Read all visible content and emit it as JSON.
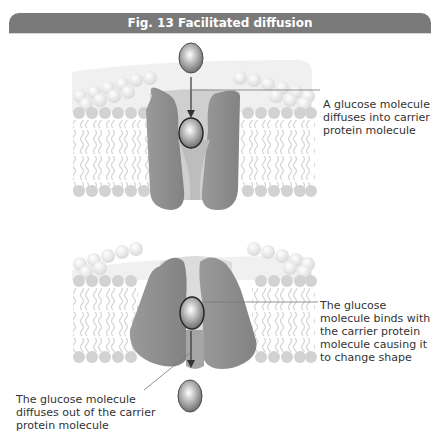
{
  "figure": {
    "title": "Fig. 13  Facilitated diffusion",
    "colors": {
      "title_bar": "#7a7a7a",
      "protein": "#8f8f8f",
      "phospholipid_head": "#d4d4d4",
      "tail": "#d8d8d8",
      "glucose": "#8a8a8a"
    }
  },
  "stages": [
    {
      "id": "stage-1",
      "annotation": "A glucose molecule diffuses into carrier protein molecule"
    },
    {
      "id": "stage-2",
      "annotation_binds": "The glucose molecule binds with the carrier protein molecule causing it to change shape",
      "annotation_exit": "The glucose molecule diffuses out of the carrier protein molecule"
    }
  ],
  "icons": {
    "glucose": "glucose-molecule-icon",
    "protein": "carrier-protein-icon",
    "membrane": "phospholipid-bilayer-icon",
    "arrow": "arrow-down-icon"
  }
}
